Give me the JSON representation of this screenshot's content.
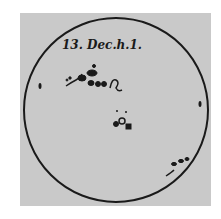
{
  "drawing": {
    "title_label": "13. Dec.h.1.",
    "subject": "sunspot drawing on solar disk",
    "colors": {
      "background": "#ffffff",
      "paper": "#c9c9c9",
      "ink": "#1a1a1a"
    },
    "disk": {
      "cx": 116,
      "cy": 110,
      "r": 92
    },
    "spot_groups": [
      {
        "name": "upper-left-group",
        "x": 85,
        "y": 83
      },
      {
        "name": "center-group",
        "x": 122,
        "y": 124
      },
      {
        "name": "lower-right-group",
        "x": 175,
        "y": 170
      }
    ]
  }
}
